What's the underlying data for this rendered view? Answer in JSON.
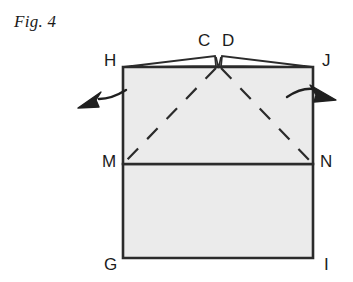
{
  "figure": {
    "caption": "Fig. 4",
    "colors": {
      "paper_fill": "#ebebeb",
      "outline": "#2b2b2b",
      "label_text": "#1b1b1b",
      "background": "#ffffff",
      "arrow": "#1f1f1f"
    },
    "vertex_labels": [
      {
        "name": "H",
        "text": "H",
        "x": 104,
        "y": 52
      },
      {
        "name": "C",
        "text": "C",
        "x": 198,
        "y": 32
      },
      {
        "name": "D",
        "text": "D",
        "x": 222,
        "y": 32
      },
      {
        "name": "J",
        "text": "J",
        "x": 322,
        "y": 52
      },
      {
        "name": "M",
        "text": "M",
        "x": 102,
        "y": 153
      },
      {
        "name": "N",
        "text": "N",
        "x": 320,
        "y": 153
      },
      {
        "name": "G",
        "text": "G",
        "x": 104,
        "y": 256
      },
      {
        "name": "I",
        "text": "I",
        "x": 324,
        "y": 256
      }
    ],
    "annotations": {
      "left_arrow": "curved-arrow-pointing-left-outward",
      "right_arrow": "curved-arrow-pointing-right-outward",
      "fold_lines": "dashed-diagonal-fold-lines-from-M-and-N-to-apex",
      "flaps": "two-triangular-flaps-meeting-at-center-notch"
    }
  }
}
